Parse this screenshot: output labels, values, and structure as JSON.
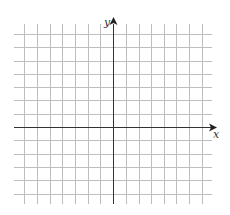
{
  "diagram": {
    "type": "coordinate-grid",
    "x_axis_label": "x",
    "y_axis_label": "y",
    "grid_color": "#bdbdbd",
    "axis_color": "#333333",
    "vertical_lines_x": [
      24,
      37,
      50,
      62,
      75,
      88,
      100,
      126,
      139,
      151,
      164,
      176,
      189,
      202
    ],
    "horizontal_lines_y": [
      34,
      47,
      61,
      74,
      87,
      100,
      114,
      140,
      154,
      167,
      180,
      194
    ],
    "y_axis_x": 113,
    "x_axis_y": 127,
    "grid_x_range": [
      14,
      212
    ],
    "grid_y_range": [
      24,
      204
    ]
  }
}
